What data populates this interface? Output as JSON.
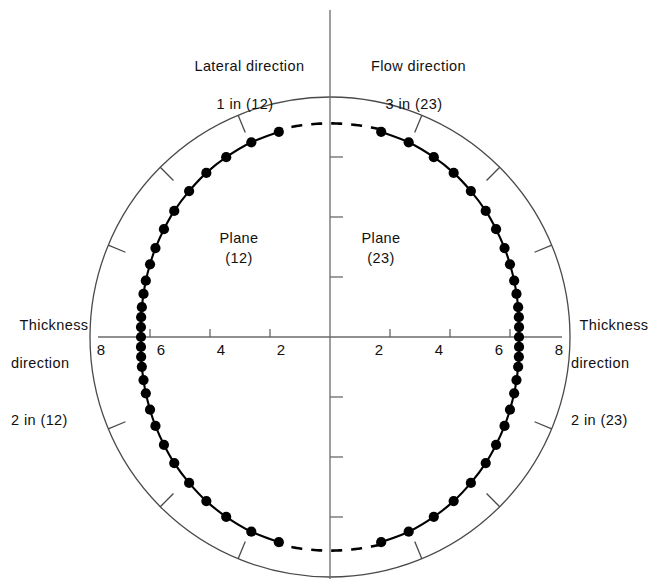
{
  "figure": {
    "title_top_left": {
      "line1": "Lateral direction",
      "line2": "1 in (12)"
    },
    "title_top_right": {
      "line1": "Flow direction",
      "line2": "3 in (23)"
    },
    "label_left": {
      "line1": "Thickness",
      "line2": "direction",
      "line3": "2 in (12)"
    },
    "label_right": {
      "line1": "Thickness",
      "line2": "direction",
      "line3": "2 in (23)"
    },
    "plane_left": {
      "line1": "Plane",
      "line2": "(12)"
    },
    "plane_right": {
      "line1": "Plane",
      "line2": "(23)"
    },
    "axis_ticks_left": [
      "8",
      "6",
      "4",
      "2"
    ],
    "axis_ticks_right": [
      "2",
      "4",
      "6",
      "8"
    ],
    "colors": {
      "ink": "#111111",
      "curve": "#000000",
      "circle": "#4a4a4a",
      "axis": "#6a6a6a"
    }
  },
  "chart_data": {
    "type": "line",
    "xlabel": "Thickness direction 2 in (12) / 2 in (23)",
    "ylabel": "Lateral direction 1 in (12) / Flow direction 3 in (23)",
    "coordinate_system": "polar",
    "radial_axis": {
      "label": "radius",
      "ticks": [
        2,
        4,
        6,
        8
      ],
      "rmax": 8,
      "reference_circle_radius": 8,
      "tick_labels_left": [
        "8",
        "6",
        "4",
        "2"
      ],
      "tick_labels_right": [
        "2",
        "4",
        "6",
        "8"
      ]
    },
    "grid": false,
    "legend": null,
    "annotations": [
      "Lateral direction 1 in (12)",
      "Flow direction 3 in (23)",
      "Thickness direction 2 in (12)",
      "Thickness direction 2 in (23)",
      "Plane (12)",
      "Plane (23)"
    ],
    "series": [
      {
        "name": "Plane (12)",
        "side": "left",
        "style": "solid-with-markers",
        "note": "solid measured arc; dashed extrapolation near the vertical axis",
        "points_polar": [
          {
            "angle_deg": 104,
            "r": 7.05
          },
          {
            "angle_deg": 112,
            "r": 7.0
          },
          {
            "angle_deg": 120,
            "r": 6.92
          },
          {
            "angle_deg": 127,
            "r": 6.85
          },
          {
            "angle_deg": 134,
            "r": 6.76
          },
          {
            "angle_deg": 141,
            "r": 6.68
          },
          {
            "angle_deg": 147,
            "r": 6.6
          },
          {
            "angle_deg": 153,
            "r": 6.53
          },
          {
            "angle_deg": 158,
            "r": 6.47
          },
          {
            "angle_deg": 163,
            "r": 6.42
          },
          {
            "angle_deg": 167,
            "r": 6.38
          },
          {
            "angle_deg": 171,
            "r": 6.35
          },
          {
            "angle_deg": 174,
            "r": 6.33
          },
          {
            "angle_deg": 177,
            "r": 6.31
          },
          {
            "angle_deg": 180,
            "r": 6.3
          },
          {
            "angle_deg": 183,
            "r": 6.31
          },
          {
            "angle_deg": 186,
            "r": 6.33
          },
          {
            "angle_deg": 189,
            "r": 6.35
          },
          {
            "angle_deg": 193,
            "r": 6.38
          },
          {
            "angle_deg": 197,
            "r": 6.42
          },
          {
            "angle_deg": 202,
            "r": 6.47
          },
          {
            "angle_deg": 207,
            "r": 6.53
          },
          {
            "angle_deg": 213,
            "r": 6.6
          },
          {
            "angle_deg": 219,
            "r": 6.68
          },
          {
            "angle_deg": 226,
            "r": 6.76
          },
          {
            "angle_deg": 233,
            "r": 6.85
          },
          {
            "angle_deg": 240,
            "r": 6.92
          },
          {
            "angle_deg": 248,
            "r": 7.0
          },
          {
            "angle_deg": 256,
            "r": 7.05
          }
        ]
      },
      {
        "name": "Plane (23)",
        "side": "right",
        "style": "solid-with-markers",
        "note": "solid measured arc; dashed extrapolation near the vertical axis",
        "points_polar": [
          {
            "angle_deg": 76,
            "r": 7.05
          },
          {
            "angle_deg": 68,
            "r": 7.0
          },
          {
            "angle_deg": 60,
            "r": 6.92
          },
          {
            "angle_deg": 53,
            "r": 6.85
          },
          {
            "angle_deg": 46,
            "r": 6.76
          },
          {
            "angle_deg": 39,
            "r": 6.68
          },
          {
            "angle_deg": 33,
            "r": 6.6
          },
          {
            "angle_deg": 27,
            "r": 6.53
          },
          {
            "angle_deg": 22,
            "r": 6.47
          },
          {
            "angle_deg": 17,
            "r": 6.42
          },
          {
            "angle_deg": 13,
            "r": 6.38
          },
          {
            "angle_deg": 9,
            "r": 6.35
          },
          {
            "angle_deg": 6,
            "r": 6.33
          },
          {
            "angle_deg": 3,
            "r": 6.31
          },
          {
            "angle_deg": 0,
            "r": 6.3
          },
          {
            "angle_deg": -3,
            "r": 6.31
          },
          {
            "angle_deg": -6,
            "r": 6.33
          },
          {
            "angle_deg": -9,
            "r": 6.35
          },
          {
            "angle_deg": -13,
            "r": 6.38
          },
          {
            "angle_deg": -17,
            "r": 6.42
          },
          {
            "angle_deg": -22,
            "r": 6.47
          },
          {
            "angle_deg": -27,
            "r": 6.53
          },
          {
            "angle_deg": -33,
            "r": 6.6
          },
          {
            "angle_deg": -39,
            "r": 6.68
          },
          {
            "angle_deg": -46,
            "r": 6.76
          },
          {
            "angle_deg": -53,
            "r": 6.85
          },
          {
            "angle_deg": -60,
            "r": 6.92
          },
          {
            "angle_deg": -68,
            "r": 7.0
          },
          {
            "angle_deg": -76,
            "r": 7.05
          }
        ]
      }
    ],
    "radial_tick_marks_deg": [
      22.5,
      45,
      67.5,
      112.5,
      135,
      157.5,
      202.5,
      225,
      247.5,
      292.5,
      315,
      337.5
    ]
  }
}
